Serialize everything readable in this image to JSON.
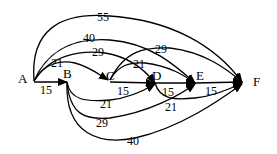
{
  "diagram": {
    "type": "directed-weighted-graph",
    "nodes": [
      {
        "id": "A",
        "label": "A"
      },
      {
        "id": "B",
        "label": "B"
      },
      {
        "id": "C",
        "label": "C"
      },
      {
        "id": "D",
        "label": "D"
      },
      {
        "id": "E",
        "label": "E"
      },
      {
        "id": "F",
        "label": "F"
      }
    ],
    "edges": [
      {
        "from": "A",
        "to": "F",
        "weight": "55"
      },
      {
        "from": "A",
        "to": "E",
        "weight": "40"
      },
      {
        "from": "A",
        "to": "D",
        "weight": "29"
      },
      {
        "from": "A",
        "to": "C",
        "weight": "21"
      },
      {
        "from": "A",
        "to": "B",
        "weight": "15"
      },
      {
        "from": "B",
        "to": "D",
        "weight": "21"
      },
      {
        "from": "B",
        "to": "E",
        "weight": "29"
      },
      {
        "from": "B",
        "to": "F",
        "weight": "40"
      },
      {
        "from": "C",
        "to": "D",
        "weight": "15"
      },
      {
        "from": "C",
        "to": "E",
        "weight": "21"
      },
      {
        "from": "C",
        "to": "F",
        "weight": "29"
      },
      {
        "from": "D",
        "to": "E",
        "weight": "15"
      },
      {
        "from": "D",
        "to": "F",
        "weight": "21"
      },
      {
        "from": "E",
        "to": "F",
        "weight": "15"
      }
    ]
  }
}
